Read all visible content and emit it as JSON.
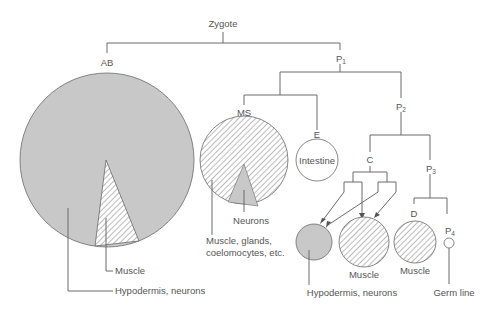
{
  "nodes": {
    "zygote": "Zygote",
    "ab": "AB",
    "p1": "P",
    "p1_sub": "1",
    "ms": "MS",
    "e": "E",
    "p2": "P",
    "p2_sub": "2",
    "c": "C",
    "p3": "P",
    "p3_sub": "3",
    "d": "D",
    "p4": "P",
    "p4_sub": "4"
  },
  "fates": {
    "ab_muscle": "Muscle",
    "ab_hypodermis": "Hypodermis, neurons",
    "ms_neurons": "Neurons",
    "ms_muscle_line1": "Muscle, glands,",
    "ms_muscle_line2": "coelomocytes, etc.",
    "e_intestine": "Intestine",
    "c_hypodermis": "Hypodermis, neurons",
    "c_muscle": "Muscle",
    "d_muscle": "Muscle",
    "p4_germ": "Germ line"
  },
  "legend_patterns": {
    "stippled_gray": "#c8c8c8",
    "hatched": "#6a6a6a",
    "outline": "#6a6a6a"
  }
}
